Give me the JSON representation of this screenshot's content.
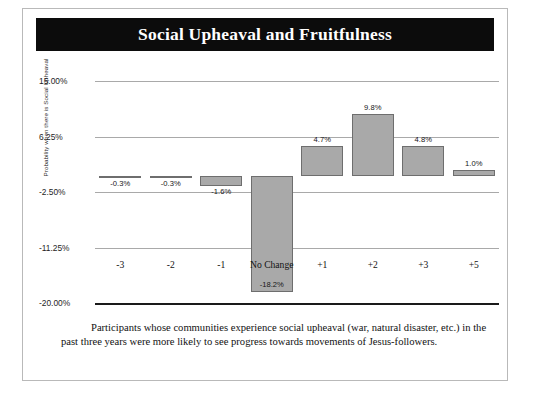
{
  "figure": {
    "title": "Social Upheaval and Fruitfulness",
    "caption": "Participants whose communities experience social upheaval (war, natural disaster, etc.) in the past three years were more likely to see progress towards movements of Jesus-followers.",
    "title_banner_color": "#0c0c0c",
    "title_text_color": "#ffffff",
    "bar_fill_color": "#a9a9a9",
    "bar_border_color": "#6e6e6e",
    "gridline_color": "#a9a9a9",
    "axis_color": "#1a1a1a",
    "frame_border_color": "#b9b9b9"
  },
  "chart_data": {
    "type": "bar",
    "title": "Social Upheaval and Fruitfulness",
    "xlabel": "",
    "ylabel": "Probability when there is Social Upheaval",
    "categories": [
      "-3",
      "-2",
      "-1",
      "No Change",
      "+1",
      "+2",
      "+3",
      "+5"
    ],
    "values": [
      -0.3,
      -0.3,
      -1.6,
      -18.2,
      4.7,
      9.8,
      4.8,
      1.0
    ],
    "data_labels": [
      "-0.3%",
      "-0.3%",
      "-1.6%",
      "-18.2%",
      "4.7%",
      "9.8%",
      "4.8%",
      "1.0%"
    ],
    "ylim": [
      -20.0,
      15.0
    ],
    "ytick_values": [
      15.0,
      6.25,
      -2.5,
      -11.25,
      -20.0
    ],
    "ytick_labels": [
      "15.00%",
      "6.25%",
      "-2.50%",
      "-11.25%",
      "-20.00%"
    ],
    "grid": true,
    "legend": false,
    "units": "percent"
  }
}
